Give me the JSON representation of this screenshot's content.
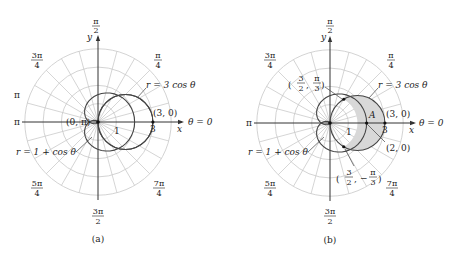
{
  "figure": {
    "panels": [
      {
        "id": "a",
        "caption": "(a)",
        "angle_labels": {
          "top": "π/2",
          "top_left": "3π/4",
          "top_right": "π/4",
          "left_upper": "π",
          "left": "π",
          "bottom_left": "5π/4",
          "bottom": "3π/2",
          "bottom_right": "7π/4",
          "right": "θ = 0"
        },
        "axis_labels": {
          "x": "x",
          "y": "y"
        },
        "tick_labels": {
          "one": "1",
          "three": "3"
        },
        "curve_labels": {
          "circle": "r = 3 cos θ",
          "cardioid": "r = 1 + cos θ"
        },
        "points": {
          "pole": "(0, π)",
          "right": "(3, 0)"
        }
      },
      {
        "id": "b",
        "caption": "(b)",
        "angle_labels": {
          "top": "π/2",
          "top_left": "3π/4",
          "top_right": "π/4",
          "left": "π",
          "bottom_left": "5π/4",
          "bottom": "3π/2",
          "bottom_right": "7π/4",
          "right": "θ = 0"
        },
        "axis_labels": {
          "x": "x",
          "y": "y"
        },
        "tick_labels": {
          "one": "1",
          "three": "3"
        },
        "curve_labels": {
          "circle": "r = 3 cos θ",
          "cardioid": "r = 1 + cos θ"
        },
        "points": {
          "upper_intersection": "(3/2, π/3)",
          "lower_intersection": "(3/2, −π/3)",
          "right": "(3, 0)",
          "cardioid_right": "(2, 0)"
        },
        "region_label": "A",
        "shade_color": "#d8d8d8"
      }
    ]
  },
  "frac": {
    "pi": "π",
    "two": "2",
    "three": "3",
    "four": "4",
    "threepi": "3π",
    "fivepi": "5π",
    "sevenpi": "7π",
    "minus": "−",
    "comma": ","
  }
}
